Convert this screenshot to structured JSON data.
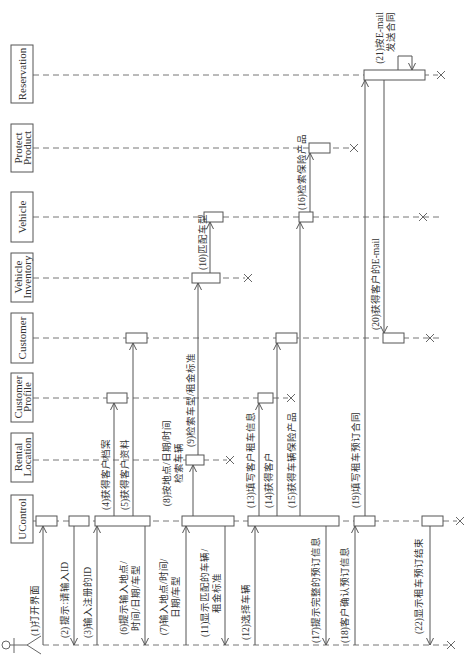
{
  "diagram": {
    "type": "sequence-diagram",
    "orientation": "rotated -90deg (time flows left to right)",
    "actor": {
      "name": ""
    },
    "lifelines": [
      {
        "id": "reservation",
        "label": [
          "Reservation"
        ]
      },
      {
        "id": "protect_product",
        "label": [
          "Protect",
          "Product"
        ]
      },
      {
        "id": "vehicle",
        "label": [
          "Vehicle"
        ]
      },
      {
        "id": "vehicle_inventory",
        "label": [
          "Vehicle",
          "Inventory"
        ]
      },
      {
        "id": "customer",
        "label": [
          "Customer"
        ]
      },
      {
        "id": "customer_profile",
        "label": [
          "Customer",
          "Profile"
        ]
      },
      {
        "id": "rental_location",
        "label": [
          "Rental",
          "Location"
        ]
      },
      {
        "id": "ucontrol",
        "label": [
          "UControl"
        ]
      }
    ],
    "messages": [
      {
        "n": 1,
        "from": "actor",
        "to": "ucontrol",
        "lines": [
          "(1)打开界面"
        ]
      },
      {
        "n": 2,
        "from": "ucontrol",
        "to": "actor",
        "lines": [
          "(2) 提示:请输入ID"
        ]
      },
      {
        "n": 3,
        "from": "actor",
        "to": "ucontrol",
        "lines": [
          "(3)输入注册的ID"
        ]
      },
      {
        "n": 4,
        "from": "ucontrol",
        "to": "customer_profile",
        "lines": [
          "(4)获得客户档案"
        ]
      },
      {
        "n": 5,
        "from": "ucontrol",
        "to": "customer",
        "lines": [
          "(5)获得客户资料"
        ]
      },
      {
        "n": 6,
        "from": "ucontrol",
        "to": "actor",
        "lines": [
          "(6)提示输入地点/",
          "时间/日期/车型"
        ]
      },
      {
        "n": 7,
        "from": "actor",
        "to": "ucontrol",
        "lines": [
          "(7)输入地点/时间/",
          "日期/车型"
        ]
      },
      {
        "n": 8,
        "from": "ucontrol",
        "to": "rental_location",
        "lines": [
          "(8)按地点/日期/时间",
          "检索车辆"
        ]
      },
      {
        "n": 9,
        "from": "rental_location",
        "to": "vehicle_inventory",
        "lines": [
          "(9)检索车型/租金标准"
        ]
      },
      {
        "n": 10,
        "from": "vehicle_inventory",
        "to": "vehicle",
        "lines": [
          "(10)匹配车型"
        ]
      },
      {
        "n": 11,
        "from": "ucontrol",
        "to": "actor",
        "lines": [
          "(11)显示匹配的车辆/",
          "租金标准"
        ]
      },
      {
        "n": 12,
        "from": "actor",
        "to": "ucontrol",
        "lines": [
          "(12)选择车辆"
        ]
      },
      {
        "n": 13,
        "from": "ucontrol",
        "to": "customer_profile",
        "lines": [
          "(13)填写客户租车信息"
        ]
      },
      {
        "n": 14,
        "from": "ucontrol",
        "to": "customer",
        "lines": [
          "(14)获得客户"
        ]
      },
      {
        "n": 15,
        "from": "ucontrol",
        "to": "vehicle",
        "lines": [
          "(15)获得车辆保险产品"
        ]
      },
      {
        "n": 16,
        "from": "vehicle",
        "to": "protect_product",
        "lines": [
          "(16)检索保险产品"
        ]
      },
      {
        "n": 17,
        "from": "ucontrol",
        "to": "actor",
        "lines": [
          "(17)提示完整的预订信息"
        ]
      },
      {
        "n": 18,
        "from": "actor",
        "to": "ucontrol",
        "lines": [
          "(18)客户确认预订信息"
        ]
      },
      {
        "n": 19,
        "from": "ucontrol",
        "to": "reservation",
        "lines": [
          "(19)填写租车预订合同"
        ]
      },
      {
        "n": 20,
        "from": "reservation",
        "to": "customer",
        "lines": [
          "(20)获得客户的E-mail"
        ]
      },
      {
        "n": 21,
        "from": "reservation",
        "to": "reservation",
        "lines": [
          "(21)按E-mail",
          "发送合同"
        ]
      },
      {
        "n": 22,
        "from": "ucontrol",
        "to": "actor",
        "lines": [
          "(22)显示租车预订结束"
        ]
      }
    ],
    "colors": {
      "line": "#555555",
      "background": "#ffffff"
    }
  }
}
